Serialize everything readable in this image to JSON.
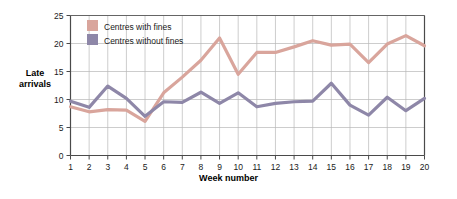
{
  "chart_data": {
    "type": "line",
    "title": "",
    "xlabel": "Week number",
    "ylabel": "Late arrivals",
    "x": [
      1,
      2,
      3,
      4,
      5,
      6,
      7,
      8,
      9,
      10,
      11,
      12,
      13,
      14,
      15,
      16,
      17,
      18,
      19,
      20
    ],
    "categories": [
      "1",
      "2",
      "3",
      "4",
      "5",
      "6",
      "7",
      "8",
      "9",
      "10",
      "11",
      "12",
      "13",
      "14",
      "15",
      "16",
      "17",
      "18",
      "19",
      "20"
    ],
    "xlim": [
      1,
      20
    ],
    "ylim": [
      0,
      25
    ],
    "yticks": [
      0,
      5,
      10,
      15,
      20,
      25
    ],
    "ytick_labels": [
      "0",
      "5",
      "10",
      "15",
      "20",
      "25"
    ],
    "grid": true,
    "legend_position": "top-left",
    "series": [
      {
        "name": "Centres with fines",
        "color": "#d9a59c",
        "values": [
          8.7,
          7.8,
          8.2,
          8.1,
          6.1,
          11.2,
          14.0,
          17.0,
          21.0,
          14.5,
          18.4,
          18.4,
          19.4,
          20.5,
          19.7,
          19.9,
          16.6,
          19.9,
          21.4,
          19.6
        ]
      },
      {
        "name": "Centres without fines",
        "color": "#8e87a8",
        "values": [
          9.7,
          8.6,
          12.4,
          10.2,
          7.0,
          9.6,
          9.5,
          11.3,
          9.3,
          11.2,
          8.7,
          9.3,
          9.6,
          9.7,
          12.9,
          9.0,
          7.2,
          10.4,
          8.0,
          10.2
        ]
      }
    ]
  },
  "axes": {
    "y_title_line1": "Late",
    "y_title_line2": "arrivals",
    "x_title": "Week number"
  },
  "legend": {
    "items": [
      {
        "label": "Centres with fines",
        "color": "#d9a59c"
      },
      {
        "label": "Centres without fines",
        "color": "#8e87a8"
      }
    ]
  },
  "colors": {
    "series_with_fines": "#d9a59c",
    "series_without_fines": "#8e87a8",
    "grid": "#b8b8b8",
    "axis": "#4a4a4a",
    "background": "#ffffff"
  }
}
